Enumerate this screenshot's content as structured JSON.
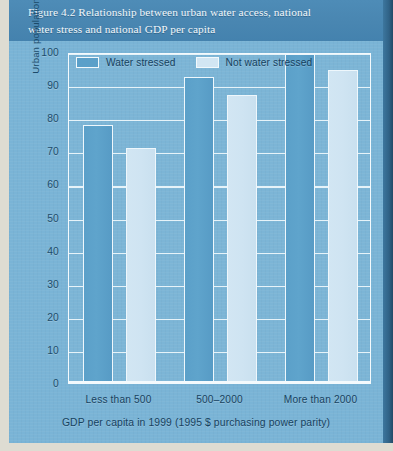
{
  "figure": {
    "label": "Figure 4.2",
    "title_line1": "Figure 4.2 Relationship between urban water access, national",
    "title_line2": "water stress and national GDP per capita"
  },
  "colors": {
    "title_band": "#4a86b1",
    "plot_background": "#7ab4d6",
    "series_water_stressed": "#5ba0c9",
    "series_not_water_stressed": "#d2e6f3",
    "gridline": "#eef7fc",
    "text": "#17425f",
    "title_text": "#f2f7fa"
  },
  "legend": {
    "position": "top-left-inside",
    "items": [
      {
        "label": "Water stressed",
        "swatch": "dark"
      },
      {
        "label": "Not water stressed",
        "swatch": "light"
      }
    ]
  },
  "axes": {
    "y": {
      "title": "Urban population with access to improved water supplies (%)",
      "ticks": [
        "100",
        "90",
        "80",
        "70",
        "60",
        "50",
        "40",
        "30",
        "20",
        "10",
        "0"
      ],
      "min": 0,
      "max": 100,
      "step": 10
    },
    "x": {
      "title": "GDP per capita in 1999 (1995 $ purchasing power parity)",
      "categories": [
        "Less than 500",
        "500–2000",
        "More than 2000"
      ]
    }
  },
  "chart_data": {
    "type": "bar",
    "title": "Figure 4.2 Relationship between urban water access, national water stress and national GDP per capita",
    "xlabel": "GDP per capita in 1999 (1995 $ purchasing power parity)",
    "ylabel": "Urban population with access to improved water supplies (%)",
    "categories": [
      "Less than 500",
      "500–2000",
      "More than 2000"
    ],
    "series": [
      {
        "name": "Water stressed",
        "color": "#5ba0c9",
        "values": [
          78,
          92.5,
          99.5
        ]
      },
      {
        "name": "Not water stressed",
        "color": "#d2e6f3",
        "values": [
          71,
          87,
          94.5
        ]
      }
    ],
    "ylim": [
      0,
      100
    ],
    "ytick_step": 10,
    "grid": true,
    "grid_axis": "y",
    "legend_position": "upper left (inside plot)"
  }
}
